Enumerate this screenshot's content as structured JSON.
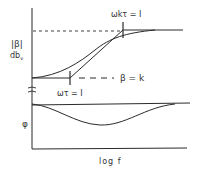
{
  "labels": {
    "mag_symbol": "|β|",
    "mag_unit": "db",
    "mag_unit_sub": "v",
    "upper_corner": "ωkτ = I",
    "lower_corner": "ωτ = I",
    "low_level": "β = k",
    "phase_symbol": "φ",
    "x_axis": "log f",
    "break_mark": "≈"
  },
  "colors": {
    "line": "#2a2a2a",
    "background": "#ffffff"
  }
}
